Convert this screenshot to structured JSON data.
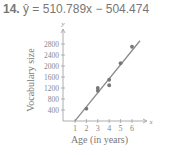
{
  "title": {
    "number": "14.",
    "equation": "ŷ = 510.789x − 504.474"
  },
  "chart_data": {
    "type": "scatter",
    "title": "ŷ = 510.789x − 504.474",
    "xlabel": "Age (in years)",
    "ylabel": "Vocabulary size",
    "x_axis_symbol": "x",
    "y_axis_symbol": "y",
    "xticks": [
      "1",
      "2",
      "3",
      "4",
      "5",
      "6"
    ],
    "yticks": [
      "400",
      "800",
      "1200",
      "1600",
      "2000",
      "2400",
      "2800"
    ],
    "xlim": [
      0.5,
      6.5
    ],
    "ylim": [
      0,
      3000
    ],
    "grid": false,
    "points": [
      {
        "x": 2,
        "y": 450
      },
      {
        "x": 3,
        "y": 1200
      },
      {
        "x": 3,
        "y": 1100
      },
      {
        "x": 4,
        "y": 1500
      },
      {
        "x": 4,
        "y": 1300
      },
      {
        "x": 5,
        "y": 2100
      },
      {
        "x": 6,
        "y": 2700
      }
    ],
    "regression_line": {
      "slope": 510.789,
      "intercept": -504.474,
      "x_start": 1,
      "x_end": 6.7
    },
    "colors": {
      "points": "#777777",
      "line": "#8a8a8a",
      "axes": "#999999"
    }
  }
}
